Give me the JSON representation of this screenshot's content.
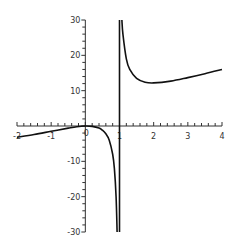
{
  "chart_data": {
    "type": "line",
    "title": "",
    "xlabel": "",
    "ylabel": "",
    "xlim": [
      -2,
      4
    ],
    "ylim": [
      -30,
      30
    ],
    "grid": false,
    "legend": null,
    "x_ticks": [
      "-2",
      "-1",
      "0",
      "1",
      "2",
      "3",
      "4"
    ],
    "y_ticks": [
      "-30",
      "-20",
      "-10",
      "0",
      "10",
      "20",
      "30"
    ],
    "vertical_asymptote": 1,
    "series": [
      {
        "name": "left branch",
        "x": [
          -2,
          -1.5,
          -1,
          -0.5,
          -0.25,
          0,
          0.2,
          0.4,
          0.5,
          0.6,
          0.7,
          0.8,
          0.85,
          0.9,
          0.93
        ],
        "y": [
          -3.2,
          -2.4,
          -1.5,
          -0.6,
          -0.2,
          0,
          -0.1,
          -0.6,
          -1.2,
          -2.2,
          -4.0,
          -8.0,
          -12.0,
          -20.0,
          -30.0
        ]
      },
      {
        "name": "right branch",
        "x": [
          1.07,
          1.1,
          1.2,
          1.3,
          1.5,
          1.75,
          2,
          2.5,
          3,
          3.5,
          4
        ],
        "y": [
          30.0,
          26.0,
          19.0,
          16.0,
          13.5,
          12.4,
          12.2,
          12.7,
          13.7,
          14.8,
          16.0
        ]
      }
    ],
    "colors": {
      "curve": "#111111",
      "axis": "#333333",
      "background": "#ffffff"
    }
  }
}
